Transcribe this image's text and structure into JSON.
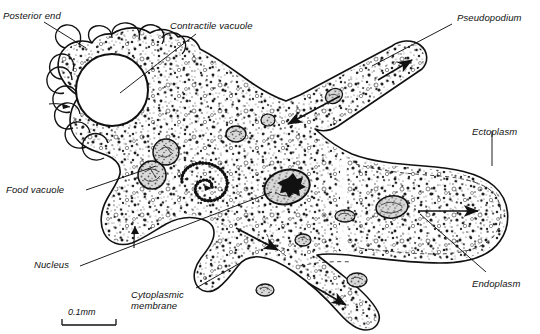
{
  "figure": {
    "style": "line-drawing",
    "ink_color": "#111111",
    "fill_color": "#ffffff",
    "stipple_color": "#2b2b2b"
  },
  "labels": {
    "posterior_end": "Posterior end",
    "contractile_vacuole": "Contractile vacuole",
    "pseudopodium": "Pseudopodium",
    "ectoplasm": "Ectoplasm",
    "endoplasm": "Endoplasm",
    "food_vacuole": "Food vacuole",
    "nucleus": "Nucleus",
    "cytoplasmic_membrane": "Cytoplasmic\nmembrane"
  },
  "scale_bar": {
    "text": "0.1mm"
  },
  "structures": {
    "contractile_vacuole_name": "contractile-vacuole",
    "nucleus_name": "nucleus",
    "food_vacuole_name": "food-vacuole",
    "spiral_vacuole_name": "spiral-vacuole",
    "uroid_name": "posterior-uroid-lobes",
    "ectoplasm_name": "ectoplasm-rim",
    "endoplasm_name": "endoplasm-region",
    "flow_arrow_name": "cytoplasmic-flow-arrow"
  }
}
